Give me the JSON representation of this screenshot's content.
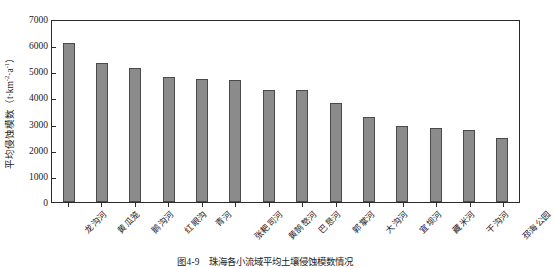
{
  "chart_data": {
    "type": "bar",
    "title": "",
    "caption": "图4-9　珠海各小流域平均土壤侵蚀模数情况",
    "caption_number": "图4-9",
    "caption_text": "珠海各小流域平均土壤侵蚀模数情况",
    "xlabel": "",
    "ylabel": "平均侵蚀模数（t·km⁻²·a⁻¹）",
    "ylabel_main": "平均侵蚀模数（t·km",
    "ylabel_sup1": "-2",
    "ylabel_mid": "·a",
    "ylabel_sup2": "-1",
    "ylabel_end": "）",
    "ylim": [
      0,
      7000
    ],
    "yticks": [
      0,
      1000,
      2000,
      3000,
      4000,
      5000,
      6000,
      7000
    ],
    "ytick_labels": [
      "0",
      "1000",
      "2000",
      "3000",
      "4000",
      "5000",
      "6000",
      "7000"
    ],
    "grid": false,
    "legend": false,
    "bar_color": "#8b8b8b",
    "bar_edge_color": "#4a4a4a",
    "axis_color": "#2b2b2b",
    "categories": [
      "龙沟河",
      "黄瓜笼",
      "鹅沟河",
      "红眼沟",
      "青河",
      "张耙司河",
      "黄鹄嶅河",
      "巴恳河",
      "郭掌河",
      "大沟河",
      "宜坝河",
      "藏米河",
      "干沟河",
      "邳海公园"
    ],
    "values": [
      6100,
      5300,
      5140,
      4790,
      4700,
      4660,
      4280,
      4290,
      3800,
      3250,
      2900,
      2830,
      2750,
      2430
    ]
  }
}
